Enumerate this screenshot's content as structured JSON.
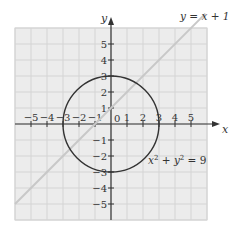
{
  "chart_data": {
    "type": "line",
    "title": "",
    "xlabel": "x",
    "ylabel": "y",
    "xlim": [
      -6,
      6
    ],
    "ylim": [
      -6,
      6
    ],
    "grid": true,
    "x_ticks": [
      -5,
      -4,
      -3,
      -2,
      -1,
      1,
      2,
      3,
      4,
      5
    ],
    "y_ticks": [
      -5,
      -4,
      -3,
      -2,
      -1,
      1,
      2,
      3,
      4,
      5
    ],
    "origin_label": "0",
    "series": [
      {
        "name": "y = x + 1",
        "kind": "line",
        "equation": "y = x + 1",
        "color": "#c8c8c8",
        "points": [
          [
            -6,
            -5
          ],
          [
            6,
            7
          ]
        ]
      },
      {
        "name": "x^2 + y^2 = 9",
        "kind": "circle",
        "equation": "x² + y² = 9",
        "center": [
          0,
          0
        ],
        "radius": 3,
        "color": "#333333"
      }
    ],
    "annotations": [
      {
        "text": "y = x + 1",
        "at": [
          5.5,
          6.7
        ]
      },
      {
        "text": "x² + y² = 9",
        "at": [
          2.3,
          -2.3
        ]
      }
    ]
  },
  "labels": {
    "x_axis": "x",
    "y_axis": "y",
    "origin": "0",
    "line_eq": "y = x + 1",
    "circle_eq_x": "x",
    "circle_eq_y": "y",
    "circle_eq_rest": " = 9",
    "plus": " + ",
    "sup2": "2"
  },
  "colors": {
    "grid_bg": "#ececec",
    "grid_line": "#d4d4d4",
    "axis": "#333333",
    "line": "#c8c8c8",
    "circle": "#333333"
  }
}
